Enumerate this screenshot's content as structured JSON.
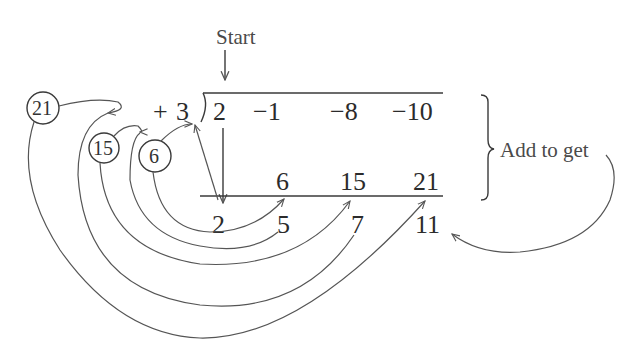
{
  "diagram": {
    "type": "synthetic-division",
    "start_label": "Start",
    "side_label": "Add to get",
    "divisor": {
      "sign": "+",
      "value": "3"
    },
    "dividend": [
      "2",
      "−1",
      "−8",
      "−10"
    ],
    "products": [
      "6",
      "15",
      "21"
    ],
    "results": [
      "2",
      "5",
      "7",
      "11"
    ],
    "circled_products": [
      "21",
      "15",
      "6"
    ],
    "colors": {
      "ink": "#2b2b2b",
      "curves": "#555555",
      "background": "#ffffff"
    }
  }
}
